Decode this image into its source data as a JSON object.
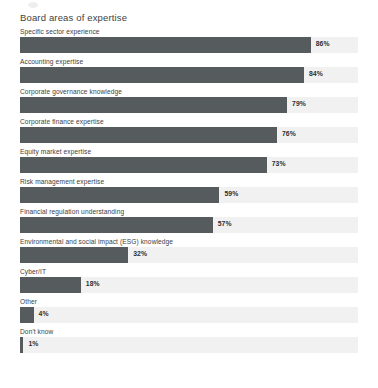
{
  "chart": {
    "title": "Board areas of expertise"
  },
  "chart_data": {
    "type": "bar",
    "orientation": "horizontal",
    "title": "Board areas of expertise",
    "xlabel": "",
    "ylabel": "",
    "xlim": [
      0,
      100
    ],
    "value_suffix": "%",
    "grid": false,
    "legend": null,
    "track_color": "#f1f1f1",
    "bar_color": "#565c5e",
    "categories": [
      "Specific sector experience",
      "Accounting expertise",
      "Corporate governance knowledge",
      "Corporate finance expertise",
      "Equity market expertise",
      "Risk management expertise",
      "Financial regulation understanding",
      "Environmental and social impact (ESG) knowledge",
      "Cyber/IT",
      "Other",
      "Don't know"
    ],
    "values": [
      86,
      84,
      79,
      76,
      73,
      59,
      57,
      32,
      18,
      4,
      1
    ],
    "value_labels": [
      "86%",
      "84%",
      "79%",
      "76%",
      "73%",
      "59%",
      "57%",
      "32%",
      "18%",
      "4%",
      "1%"
    ]
  }
}
